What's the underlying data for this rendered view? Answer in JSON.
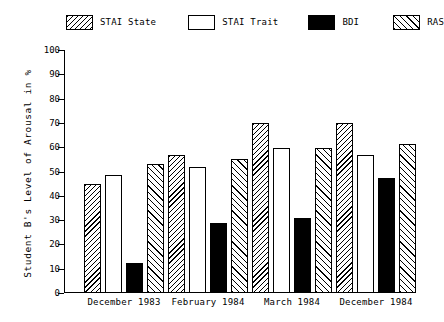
{
  "chart_data": {
    "type": "bar",
    "title": "",
    "xlabel": "",
    "ylabel": "Student B's Level of Arousal in %",
    "ylim": [
      0,
      100
    ],
    "ytick_labels": [
      "0",
      "10",
      "20",
      "30",
      "40",
      "50",
      "60",
      "70",
      "80",
      "90",
      "100"
    ],
    "ytick_values": [
      0,
      10,
      20,
      30,
      40,
      50,
      60,
      70,
      80,
      90,
      100
    ],
    "grid": false,
    "legend_position": "top",
    "categories": [
      "December 1983",
      "February 1984",
      "March 1984",
      "December 1984"
    ],
    "series": [
      {
        "name": "STAI State",
        "fill": "hatch-backslash",
        "values": [
          45,
          57,
          70,
          70
        ]
      },
      {
        "name": "STAI Trait",
        "fill": "none",
        "values": [
          48.5,
          52,
          59.5,
          57
        ]
      },
      {
        "name": "BDI",
        "fill": "solid-black",
        "values": [
          12.5,
          29,
          31,
          47.5
        ]
      },
      {
        "name": "RAS",
        "fill": "hatch-forwardslash",
        "values": [
          53,
          55,
          59.5,
          61.5
        ]
      }
    ]
  },
  "legend": {
    "items": [
      {
        "label": "STAI State",
        "fill": "hatch-backslash"
      },
      {
        "label": "STAI Trait",
        "fill": "none"
      },
      {
        "label": "BDI",
        "fill": "solid-black"
      },
      {
        "label": "RAS",
        "fill": "hatch-forwardslash"
      }
    ]
  }
}
